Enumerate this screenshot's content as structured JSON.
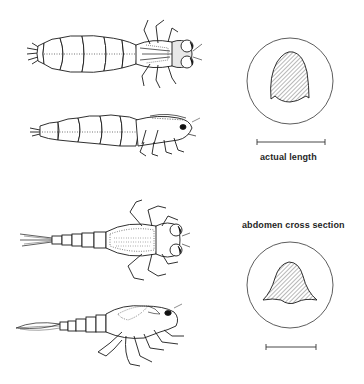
{
  "figure": {
    "specimens": [
      {
        "id": "dragonfly-nymph-dorsal",
        "view": "dorsal view",
        "group": "dragonfly nymph"
      },
      {
        "id": "dragonfly-nymph-lateral",
        "view": "lateral view",
        "group": "dragonfly nymph"
      },
      {
        "id": "damselfly-nymph-dorsal",
        "view": "dorsal view",
        "group": "damselfly nymph"
      },
      {
        "id": "damselfly-nymph-lateral",
        "view": "lateral view",
        "group": "damselfly nymph"
      }
    ],
    "cross_sections": [
      {
        "id": "dragonfly-abdomen-cross-section",
        "shape": "rounded dome"
      },
      {
        "id": "damselfly-abdomen-cross-section",
        "shape": "bell"
      }
    ],
    "labels": {
      "scale_bar": "actual length",
      "cross_section": "abdomen cross section"
    },
    "colors": {
      "ink": "#1a1a1a",
      "background": "#ffffff"
    }
  }
}
